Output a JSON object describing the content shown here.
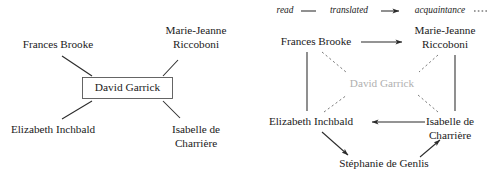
{
  "figure": {
    "title": "",
    "panels": [
      {
        "id": "left",
        "name": "ego-network-david-garrick",
        "center_node": "David Garrick",
        "nodes": [
          "Frances Brooke",
          "Marie-Jeanne Riccoboni",
          "David Garrick",
          "Elizabeth Inchbald",
          "Isabelle de Charrière"
        ]
      },
      {
        "id": "right",
        "name": "network-without-ego",
        "center_node": "David Garrick",
        "nodes": [
          "Frances Brooke",
          "Marie-Jeanne Riccoboni",
          "David Garrick",
          "Elizabeth Inchbald",
          "Isabelle de Charrière",
          "Stéphanie de Genlis"
        ]
      }
    ]
  },
  "legend": {
    "name": "relation-legend",
    "items": [
      {
        "label": "read",
        "style": "solid-line"
      },
      {
        "label": "translated",
        "style": "arrow"
      },
      {
        "label": "acquaintance",
        "style": "dotted-line"
      }
    ],
    "raw": "read — translated → acquaintance ·····"
  },
  "left_panel": {
    "nodes": [
      {
        "id": "fb",
        "label": "Frances Brooke",
        "lines": [
          "Frances Brooke"
        ],
        "x": 58,
        "y": 45,
        "boxed": false,
        "dim": false
      },
      {
        "id": "mjr",
        "label": "Marie-Jeanne Riccoboni",
        "lines": [
          "Marie-Jeanne",
          "Riccoboni"
        ],
        "x": 196,
        "y": 37,
        "boxed": false,
        "dim": false
      },
      {
        "id": "dg",
        "label": "David Garrick",
        "lines": [
          "David Garrick"
        ],
        "x": 127,
        "y": 88,
        "boxed": true,
        "dim": false
      },
      {
        "id": "ei",
        "label": "Elizabeth Inchbald",
        "lines": [
          "Elizabeth Inchbald"
        ],
        "x": 50,
        "y": 130,
        "boxed": false,
        "dim": false
      },
      {
        "id": "ic",
        "label": "Isabelle de Charrière",
        "lines": [
          "Isabelle de",
          "Charrière"
        ],
        "x": 196,
        "y": 130,
        "boxed": false,
        "dim": false
      }
    ],
    "edges": [
      {
        "from": "fb",
        "to": "dg",
        "style": "solid",
        "arrow": "none"
      },
      {
        "from": "mjr",
        "to": "dg",
        "style": "solid",
        "arrow": "none"
      },
      {
        "from": "ei",
        "to": "dg",
        "style": "solid",
        "arrow": "none"
      },
      {
        "from": "ic",
        "to": "dg",
        "style": "solid",
        "arrow": "none"
      }
    ]
  },
  "right_panel": {
    "nodes": [
      {
        "id": "fb",
        "label": "Frances Brooke",
        "lines": [
          "Frances Brooke"
        ],
        "x": 68,
        "y": 42,
        "dim": false
      },
      {
        "id": "mjr",
        "label": "Marie-Jeanne Riccoboni",
        "lines": [
          "Marie-Jeanne",
          "Riccoboni"
        ],
        "x": 196,
        "y": 37,
        "dim": false
      },
      {
        "id": "dg",
        "label": "David Garrick",
        "lines": [
          "David Garrick"
        ],
        "x": 133,
        "y": 84,
        "dim": true
      },
      {
        "id": "ei",
        "label": "Elizabeth Inchbald",
        "lines": [
          "Elizabeth Inchbald"
        ],
        "x": 63,
        "y": 122,
        "dim": false
      },
      {
        "id": "ic",
        "label": "Isabelle de Charrière",
        "lines": [
          "Isabelle de",
          "Charrière"
        ],
        "x": 198,
        "y": 122,
        "dim": false
      },
      {
        "id": "sg",
        "label": "Stéphanie de Genlis",
        "lines": [
          "Stéphanie de Genlis"
        ],
        "x": 135,
        "y": 164,
        "dim": false
      }
    ],
    "edges": [
      {
        "from": "fb",
        "to": "mjr",
        "style": "solid",
        "arrow": "forward",
        "relation": "translated"
      },
      {
        "from": "fb",
        "to": "ei",
        "style": "solid",
        "arrow": "none",
        "relation": "read"
      },
      {
        "from": "mjr",
        "to": "ic",
        "style": "solid",
        "arrow": "none",
        "relation": "read"
      },
      {
        "from": "ic",
        "to": "ei",
        "style": "solid",
        "arrow": "forward",
        "relation": "translated"
      },
      {
        "from": "ei",
        "to": "sg",
        "style": "solid",
        "arrow": "forward",
        "relation": "translated"
      },
      {
        "from": "sg",
        "to": "ic",
        "style": "solid",
        "arrow": "forward",
        "relation": "translated"
      },
      {
        "from": "fb",
        "to": "dg",
        "style": "dotted",
        "arrow": "none",
        "relation": "acquaintance"
      },
      {
        "from": "mjr",
        "to": "dg",
        "style": "dotted",
        "arrow": "none",
        "relation": "acquaintance"
      },
      {
        "from": "ei",
        "to": "dg",
        "style": "dotted",
        "arrow": "none",
        "relation": "acquaintance"
      },
      {
        "from": "ic",
        "to": "dg",
        "style": "dotted",
        "arrow": "none",
        "relation": "acquaintance"
      }
    ]
  }
}
